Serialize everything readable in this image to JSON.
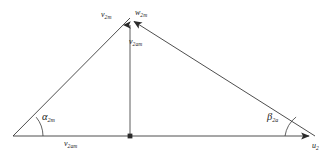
{
  "figure": {
    "type": "velocity-triangle-diagram",
    "stroke_color": "#3a3a3a",
    "label_color": "#1a1a1a",
    "background_color": "#ffffff",
    "labels": {
      "apex_left_vector": "v",
      "apex_left_vector_sub": "2m",
      "apex_right_vector": "w",
      "apex_right_vector_sub": "2m",
      "vertical_vector": "v",
      "vertical_vector_sub": "2am",
      "base_vector": "v",
      "base_vector_sub": "2am",
      "base_right_vector": "u",
      "base_right_vector_sub": "2",
      "left_angle": "α",
      "left_angle_sub": "2m",
      "right_angle": "β",
      "right_angle_sub": "2a"
    },
    "geometry": {
      "left_vertex": [
        13,
        136
      ],
      "right_vertex": [
        315,
        136
      ],
      "apex": [
        130,
        18
      ],
      "base_midpoint": [
        130,
        136
      ],
      "left_angle_arc_radius": 30,
      "right_angle_arc_radius": 30
    }
  }
}
